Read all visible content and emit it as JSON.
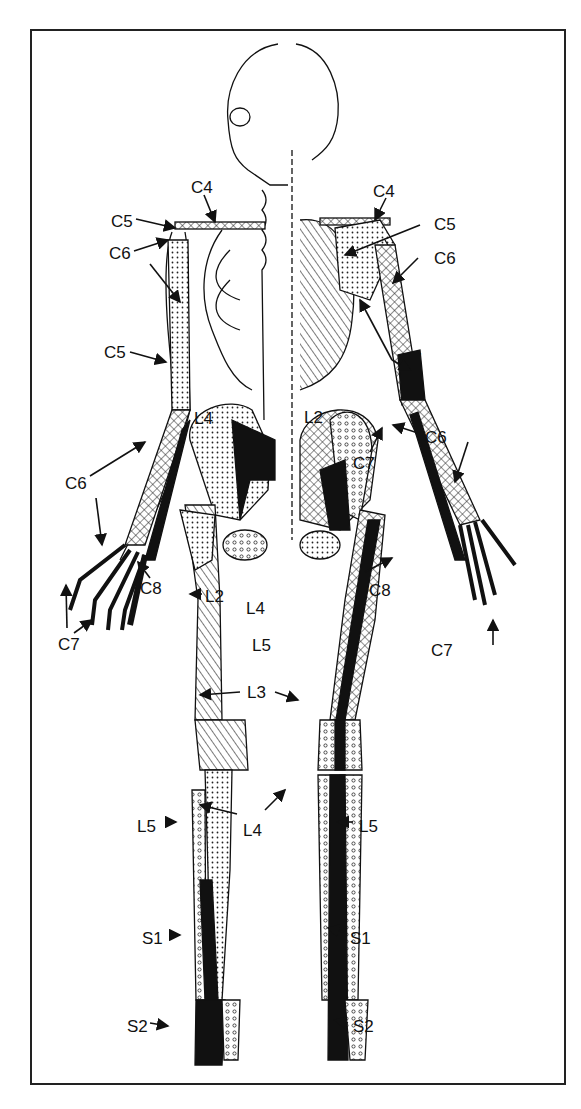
{
  "diagram": {
    "labels": [
      {
        "id": "c4-left",
        "text": "C4",
        "x": 191,
        "y": 179
      },
      {
        "id": "c4-right",
        "text": "C4",
        "x": 373,
        "y": 183
      },
      {
        "id": "c5-left-shoulder",
        "text": "C5",
        "x": 111,
        "y": 213
      },
      {
        "id": "c5-right-shoulder",
        "text": "C5",
        "x": 434,
        "y": 216
      },
      {
        "id": "c6-left-shoulder",
        "text": "C6",
        "x": 109,
        "y": 245
      },
      {
        "id": "c6-right-shoulder",
        "text": "C6",
        "x": 434,
        "y": 250
      },
      {
        "id": "c5-left-arm",
        "text": "C5",
        "x": 104,
        "y": 344
      },
      {
        "id": "c7-right-arm",
        "text": "C7",
        "x": 400,
        "y": 351
      },
      {
        "id": "l4-upper-left",
        "text": "L4",
        "x": 194,
        "y": 410
      },
      {
        "id": "l2-upper-right",
        "text": "L2",
        "x": 304,
        "y": 409
      },
      {
        "id": "c6-right-forearm",
        "text": "C6",
        "x": 425,
        "y": 429
      },
      {
        "id": "c7-right-wrist",
        "text": "C7",
        "x": 353,
        "y": 455
      },
      {
        "id": "c6-left-forearm",
        "text": "C6",
        "x": 65,
        "y": 475
      },
      {
        "id": "c8-left",
        "text": "C8",
        "x": 140,
        "y": 580
      },
      {
        "id": "l2-lower-left",
        "text": "L2",
        "x": 205,
        "y": 588
      },
      {
        "id": "l4-lower",
        "text": "L4",
        "x": 246,
        "y": 600
      },
      {
        "id": "c8-right",
        "text": "C8",
        "x": 369,
        "y": 582
      },
      {
        "id": "c7-left-hand",
        "text": "C7",
        "x": 58,
        "y": 636
      },
      {
        "id": "l5-pelvis",
        "text": "L5",
        "x": 252,
        "y": 637
      },
      {
        "id": "c7-right-hand",
        "text": "C7",
        "x": 431,
        "y": 642
      },
      {
        "id": "l3",
        "text": "L3",
        "x": 247,
        "y": 684
      },
      {
        "id": "l5-left-leg",
        "text": "L5",
        "x": 137,
        "y": 818
      },
      {
        "id": "l4-leg",
        "text": "L4",
        "x": 243,
        "y": 822
      },
      {
        "id": "l5-right-leg",
        "text": "L5",
        "x": 359,
        "y": 818
      },
      {
        "id": "s1-left",
        "text": "S1",
        "x": 142,
        "y": 930
      },
      {
        "id": "s1-right",
        "text": "S1",
        "x": 350,
        "y": 930
      },
      {
        "id": "s2-left",
        "text": "S2",
        "x": 127,
        "y": 1018
      },
      {
        "id": "s2-right",
        "text": "S2",
        "x": 353,
        "y": 1018
      }
    ],
    "legend_patterns": [
      "solid-black",
      "dotted",
      "cross-hatched",
      "diagonal-lines",
      "open-circles"
    ]
  }
}
